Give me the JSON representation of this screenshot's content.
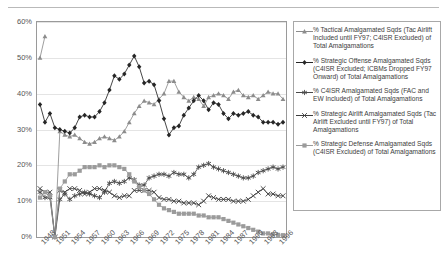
{
  "top_cropped_text": "······  ·· ·   ·  · ·    ·  ··",
  "axes": {
    "y_ticks": [
      "0%",
      "10%",
      "20%",
      "30%",
      "40%",
      "50%",
      "60%"
    ],
    "x_ticks": [
      "1948",
      "1951",
      "1954",
      "1957",
      "1960",
      "1963",
      "1966",
      "1969",
      "1972",
      "1975",
      "1978",
      "1981",
      "1984",
      "1987",
      "1990",
      "1993",
      "1996"
    ]
  },
  "legend": {
    "items": [
      {
        "marker": "triangle",
        "color": "#8c8c8c",
        "label": "% Tactical Amalgamated Sqds (Tac Airlift Included until FY97; C4ISR Excluded) of Total Amalgamations"
      },
      {
        "marker": "diamond",
        "color": "#262626",
        "label": "% Strategic Offense Amalgamated Sqds (C4ISR Excluded; ICBMs Dropped FY97 Onward) of Total Amalgamations"
      },
      {
        "marker": "star",
        "color": "#4a4a4a",
        "label": "% C4ISR Amalgamated Sqds (FAC and EW Included) of Total Amalgamations"
      },
      {
        "marker": "x",
        "color": "#3d3d3d",
        "label": "% Strategic Airlift Amalgamated Sqds (Tac Airlift Excluded until FY97) of Total Amalgamations"
      },
      {
        "marker": "square",
        "color": "#9b9b9b",
        "label": "% Strategic Defense Amalgamated Sqds (C4ISR Excluded) of Total Amalgamations"
      }
    ]
  },
  "chart_data": {
    "type": "line",
    "title": "",
    "xlabel": "",
    "ylabel": "",
    "ylim": [
      0,
      60
    ],
    "y_tick_step": 10,
    "grid": true,
    "legend_position": "right",
    "x": [
      1948,
      1949,
      1950,
      1951,
      1952,
      1953,
      1954,
      1955,
      1956,
      1957,
      1958,
      1959,
      1960,
      1961,
      1962,
      1963,
      1964,
      1965,
      1966,
      1967,
      1968,
      1969,
      1970,
      1971,
      1972,
      1973,
      1974,
      1975,
      1976,
      1977,
      1978,
      1979,
      1980,
      1981,
      1982,
      1983,
      1984,
      1985,
      1986,
      1987,
      1988,
      1989,
      1990,
      1991,
      1992,
      1993,
      1994,
      1995,
      1996,
      1997
    ],
    "series": [
      {
        "name": "% Tactical Amalgamated Sqds (Tac Airlift Included until FY97; C4ISR Excluded) of Total Amalgamations",
        "marker": "triangle",
        "color": "#8c8c8c",
        "values": [
          50.0,
          56.0,
          null,
          0.0,
          29.5,
          28.5,
          28.0,
          28.5,
          27.5,
          26.5,
          26.0,
          26.5,
          27.5,
          28.0,
          27.5,
          27.0,
          28.0,
          29.5,
          32.0,
          34.5,
          36.5,
          38.0,
          37.5,
          37.0,
          38.5,
          40.0,
          43.5,
          43.5,
          40.5,
          39.0,
          38.0,
          39.0,
          38.5,
          36.5,
          39.0,
          39.5,
          40.0,
          39.5,
          38.5,
          40.5,
          41.0,
          39.5,
          39.0,
          39.5,
          38.5,
          39.5,
          40.5,
          40.0,
          40.0,
          38.5
        ]
      },
      {
        "name": "% Strategic Offense Amalgamated Sqds (C4ISR Excluded; ICBMs Dropped FY97 Onward) of Total Amalgamations",
        "marker": "diamond",
        "color": "#262626",
        "values": [
          37.0,
          32.0,
          34.5,
          30.5,
          30.0,
          29.5,
          29.0,
          30.5,
          33.5,
          34.0,
          33.5,
          33.5,
          35.0,
          37.5,
          41.0,
          45.0,
          44.0,
          45.5,
          48.0,
          50.5,
          47.5,
          43.0,
          43.5,
          42.5,
          38.0,
          33.0,
          28.5,
          30.5,
          31.0,
          34.0,
          36.0,
          38.0,
          39.5,
          38.0,
          35.5,
          37.5,
          37.0,
          34.5,
          33.0,
          34.5,
          34.0,
          34.5,
          35.0,
          34.0,
          33.5,
          32.0,
          32.0,
          32.0,
          31.5,
          32.0
        ]
      },
      {
        "name": "% C4ISR Amalgamated Sqds (FAC and EW Included) of Total Amalgamations",
        "marker": "star",
        "color": "#4a4a4a",
        "values": [
          12.5,
          11.0,
          11.0,
          0.0,
          10.5,
          12.0,
          10.5,
          11.5,
          12.0,
          12.5,
          12.0,
          11.5,
          11.0,
          12.5,
          15.0,
          15.5,
          15.0,
          15.5,
          16.5,
          16.0,
          14.5,
          14.5,
          16.5,
          17.0,
          17.5,
          17.5,
          17.0,
          18.0,
          17.5,
          17.5,
          16.5,
          17.5,
          19.5,
          20.0,
          20.5,
          19.5,
          19.0,
          18.5,
          18.0,
          17.5,
          17.0,
          16.5,
          16.5,
          17.0,
          18.0,
          18.5,
          19.0,
          19.5,
          19.0,
          19.5
        ]
      },
      {
        "name": "% Strategic Airlift Amalgamated Sqds (Tac Airlift Excluded until FY97) of Total Amalgamations",
        "marker": "x",
        "color": "#3d3d3d",
        "values": [
          13.5,
          12.5,
          12.5,
          0.0,
          13.0,
          12.5,
          13.5,
          13.5,
          13.0,
          12.0,
          12.5,
          13.5,
          13.5,
          13.0,
          12.5,
          11.5,
          11.0,
          11.5,
          11.5,
          13.0,
          13.0,
          13.0,
          13.0,
          12.5,
          11.0,
          10.5,
          10.5,
          10.0,
          10.0,
          9.5,
          9.5,
          9.5,
          9.0,
          10.0,
          11.5,
          11.0,
          10.5,
          10.5,
          10.5,
          10.0,
          10.0,
          10.0,
          10.5,
          11.5,
          12.5,
          13.5,
          12.0,
          12.0,
          11.5,
          11.5
        ]
      },
      {
        "name": "% Strategic Defense Amalgamated Sqds (C4ISR Excluded) of Total Amalgamations",
        "marker": "square",
        "color": "#9b9b9b",
        "values": [
          11.0,
          12.5,
          11.5,
          0.0,
          13.5,
          15.5,
          17.5,
          17.5,
          18.5,
          19.5,
          19.5,
          19.5,
          20.0,
          19.5,
          20.0,
          20.0,
          19.5,
          19.0,
          17.5,
          15.5,
          14.0,
          13.0,
          12.0,
          10.5,
          9.0,
          8.0,
          7.5,
          7.0,
          6.5,
          6.5,
          6.5,
          6.5,
          6.0,
          6.0,
          5.5,
          5.5,
          5.5,
          5.0,
          4.5,
          4.0,
          3.5,
          3.0,
          2.5,
          2.0,
          1.5,
          1.0,
          1.0,
          0.8,
          0.6,
          0.5
        ]
      }
    ]
  }
}
